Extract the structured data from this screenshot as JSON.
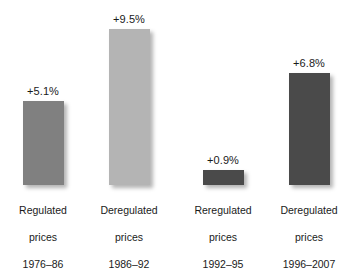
{
  "chart_data": {
    "type": "bar",
    "title": "",
    "subtitle": "",
    "xlabel": "",
    "ylabel": "",
    "ylim": [
      0,
      10.5
    ],
    "grid": false,
    "legend": false,
    "value_suffix": "%",
    "categories": [
      "Regulated prices 1976–86",
      "Deregulated prices 1986–92",
      "Reregulated prices 1992–95",
      "Deregulated prices 1996–2007"
    ],
    "values": [
      5.1,
      9.5,
      0.9,
      6.8
    ],
    "data_labels": [
      "+5.1%",
      "+9.5%",
      "+0.9%",
      "+6.8%"
    ],
    "bar_colors": [
      "#808080",
      "#b4b4b4",
      "#4a4a4a",
      "#4a4a4a"
    ],
    "bars": [
      {
        "value": 5.1,
        "data_label": "+5.1%",
        "color": "#808080",
        "category_lines": [
          "Regulated",
          "prices",
          "1976–86"
        ],
        "regime": "Regulated",
        "period": "1976–86"
      },
      {
        "value": 9.5,
        "data_label": "+9.5%",
        "color": "#b4b4b4",
        "category_lines": [
          "Deregulated",
          "prices",
          "1986–92"
        ],
        "regime": "Deregulated",
        "period": "1986–92"
      },
      {
        "value": 0.9,
        "data_label": "+0.9%",
        "color": "#4a4a4a",
        "category_lines": [
          "Reregulated",
          "prices",
          "1992–95"
        ],
        "regime": "Reregulated",
        "period": "1992–95"
      },
      {
        "value": 6.8,
        "data_label": "+6.8%",
        "color": "#4a4a4a",
        "category_lines": [
          "Deregulated",
          "prices",
          "1996–2007"
        ],
        "regime": "Deregulated",
        "period": "1996–2007"
      }
    ]
  },
  "style": {
    "background": "#ffffff",
    "text_color": "#1a1a1a",
    "px_per_unit": 16.4,
    "baseline_y": 185
  }
}
